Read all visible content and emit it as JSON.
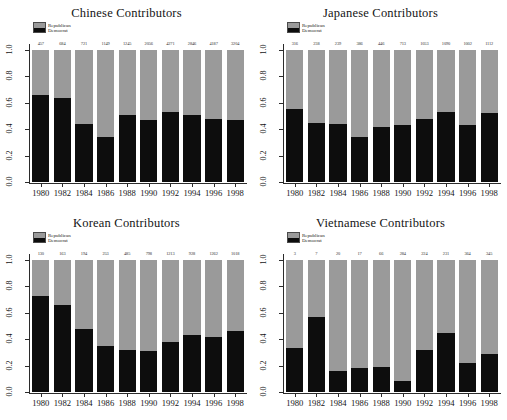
{
  "figure": {
    "panels": [
      "chinese",
      "japanese",
      "korean",
      "vietnamese"
    ],
    "legend": {
      "republican_label": "Republican",
      "democrat_label": "Democrat",
      "republican_color": "#9a9a9a",
      "democrat_color": "#0d0d0d"
    },
    "caption_partial": "",
    "y_ticks": [
      "0.0",
      "0.2",
      "0.4",
      "0.6",
      "0.8",
      "1.0"
    ],
    "x_ticks": [
      "1980",
      "1982",
      "1984",
      "1986",
      "1988",
      "1990",
      "1992",
      "1994",
      "1996",
      "1998"
    ]
  },
  "chart_data": [
    {
      "type": "bar",
      "id": "chinese",
      "title": "Chinese Contributors",
      "xlabel": "",
      "ylabel": "",
      "ylim": [
        0.0,
        1.0
      ],
      "grid": false,
      "stacked": true,
      "legend_position": "top-left",
      "categories": [
        "1980",
        "1982",
        "1984",
        "1986",
        "1988",
        "1990",
        "1992",
        "1994",
        "1996",
        "1998"
      ],
      "series": [
        {
          "name": "Democrat",
          "values": [
            0.66,
            0.64,
            0.44,
            0.34,
            0.51,
            0.47,
            0.53,
            0.51,
            0.48,
            0.47
          ]
        },
        {
          "name": "Republican",
          "values": [
            0.34,
            0.36,
            0.56,
            0.66,
            0.49,
            0.53,
            0.47,
            0.49,
            0.52,
            0.53
          ]
        }
      ],
      "point_labels": [
        "457",
        "684",
        "721",
        "1149",
        "1245",
        "2056",
        "4271",
        "2846",
        "4187",
        "3204"
      ]
    },
    {
      "type": "bar",
      "id": "japanese",
      "title": "Japanese Contributors",
      "xlabel": "",
      "ylabel": "",
      "ylim": [
        0.0,
        1.0
      ],
      "grid": false,
      "stacked": true,
      "legend_position": "top-left",
      "categories": [
        "1980",
        "1982",
        "1984",
        "1986",
        "1988",
        "1990",
        "1992",
        "1994",
        "1996",
        "1998"
      ],
      "series": [
        {
          "name": "Democrat",
          "values": [
            0.55,
            0.45,
            0.44,
            0.34,
            0.42,
            0.43,
            0.48,
            0.53,
            0.43,
            0.52
          ]
        },
        {
          "name": "Republican",
          "values": [
            0.45,
            0.55,
            0.56,
            0.66,
            0.58,
            0.57,
            0.52,
            0.47,
            0.57,
            0.48
          ]
        }
      ],
      "point_labels": [
        "316",
        "238",
        "239",
        "386",
        "446",
        "713",
        "1053",
        "1090",
        "1002",
        "1112"
      ]
    },
    {
      "type": "bar",
      "id": "korean",
      "title": "Korean Contributors",
      "xlabel": "",
      "ylabel": "",
      "ylim": [
        0.0,
        1.0
      ],
      "grid": false,
      "stacked": true,
      "legend_position": "top-left",
      "categories": [
        "1980",
        "1982",
        "1984",
        "1986",
        "1988",
        "1990",
        "1992",
        "1994",
        "1996",
        "1998"
      ],
      "series": [
        {
          "name": "Democrat",
          "values": [
            0.73,
            0.66,
            0.48,
            0.35,
            0.32,
            0.31,
            0.38,
            0.43,
            0.42,
            0.46
          ]
        },
        {
          "name": "Republican",
          "values": [
            0.27,
            0.34,
            0.52,
            0.65,
            0.68,
            0.69,
            0.62,
            0.57,
            0.58,
            0.54
          ]
        }
      ],
      "point_labels": [
        "130",
        "163",
        "194",
        "253",
        "485",
        "798",
        "1213",
        "928",
        "1262",
        "1018"
      ]
    },
    {
      "type": "bar",
      "id": "vietnamese",
      "title": "Vietnamese Contributors",
      "xlabel": "",
      "ylabel": "",
      "ylim": [
        0.0,
        1.0
      ],
      "grid": false,
      "stacked": true,
      "legend_position": "top-left",
      "categories": [
        "1980",
        "1982",
        "1984",
        "1986",
        "1988",
        "1990",
        "1992",
        "1994",
        "1996",
        "1998"
      ],
      "series": [
        {
          "name": "Democrat",
          "values": [
            0.33,
            0.57,
            0.16,
            0.18,
            0.19,
            0.08,
            0.32,
            0.45,
            0.22,
            0.29
          ]
        },
        {
          "name": "Republican",
          "values": [
            0.67,
            0.43,
            0.84,
            0.82,
            0.81,
            0.92,
            0.68,
            0.55,
            0.78,
            0.71
          ]
        }
      ],
      "point_labels": [
        "3",
        "7",
        "20",
        "17",
        "66",
        "284",
        "224",
        "231",
        "364",
        "345"
      ]
    }
  ]
}
